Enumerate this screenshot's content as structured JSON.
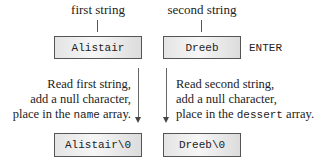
{
  "top": {
    "left_caption": "first string",
    "right_caption": "second string",
    "left_box": "Alistair",
    "right_box": "Dreeb",
    "enter_key": "ENTER"
  },
  "middle": {
    "left_text": {
      "line1": "Read first string,",
      "line2": "add a null character,",
      "line3_pre": "place in the ",
      "line3_code": "name",
      "line3_post": " array."
    },
    "right_text": {
      "line1": "Read second string,",
      "line2": "add a null character,",
      "line3_pre": "place in the ",
      "line3_code": "dessert",
      "line3_post": " array."
    }
  },
  "bottom": {
    "left_box": "Alistair\\0",
    "right_box": "Dreeb\\0"
  }
}
